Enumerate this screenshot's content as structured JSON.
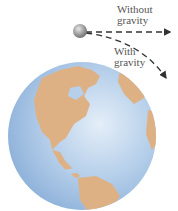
{
  "labels": {
    "without": [
      "Without",
      "gravity"
    ],
    "with": [
      "With",
      "gravity"
    ]
  },
  "colors": {
    "ocean": "#a9c6e6",
    "land": "#deb184",
    "ball": "#9a9a9a",
    "arrow": "#333333",
    "text": "#555555"
  },
  "icons": {
    "projectile": "gray-sphere",
    "earth": "globe-north-america"
  }
}
